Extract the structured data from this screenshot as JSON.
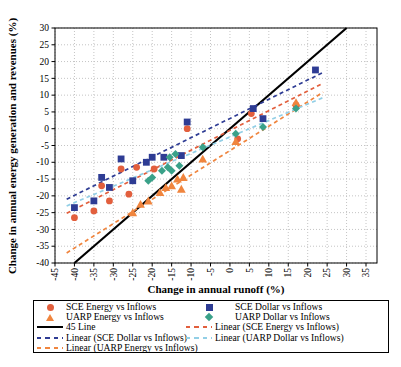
{
  "x_axis": {
    "title": "Change in annual runoff (%)",
    "ticks": [
      -45,
      -40,
      -35,
      -30,
      -25,
      -20,
      -15,
      -10,
      -5,
      0,
      5,
      10,
      15,
      20,
      25,
      30,
      35
    ],
    "min": -45,
    "max": 35
  },
  "y_axis": {
    "title": "Change in annual energy generation and revenues (%)",
    "ticks": [
      30,
      25,
      20,
      15,
      10,
      5,
      0,
      -5,
      -10,
      -15,
      -20,
      -25,
      -30,
      -35,
      -40
    ],
    "min": -40,
    "max": 30
  },
  "colors": {
    "sce_energy": "#e25f3d",
    "sce_dollar": "#2e3c94",
    "uarp_energy": "#f0853e",
    "uarp_dollar": "#3aa189",
    "uarp_dollar_line": "#92cfe6",
    "line_45": "#000000",
    "grid": "#c4c4c4",
    "axis": "#000000"
  },
  "chart_data": {
    "type": "scatter",
    "xlabel": "Change in annual runoff (%)",
    "ylabel": "Change in annual energy generation and revenues (%)",
    "xlim": [
      -45,
      37
    ],
    "ylim": [
      -40,
      30
    ],
    "grid": "dotted",
    "series": [
      {
        "name": "SCE Energy vs Inflows",
        "marker": "circle",
        "color": "#e25f3d",
        "points": [
          [
            -40,
            -26.5
          ],
          [
            -35,
            -24.5
          ],
          [
            -33,
            -17
          ],
          [
            -31,
            -21.5
          ],
          [
            -28,
            -12
          ],
          [
            -26,
            -19.5
          ],
          [
            -24,
            -11.5
          ],
          [
            -19.5,
            -12
          ],
          [
            -11,
            0
          ],
          [
            2,
            -3
          ],
          [
            5.5,
            4.5
          ],
          [
            17,
            7
          ]
        ]
      },
      {
        "name": "SCE Dollar vs Inflows",
        "marker": "square",
        "color": "#2e3c94",
        "points": [
          [
            -40,
            -23.5
          ],
          [
            -35,
            -21.5
          ],
          [
            -33,
            -14.5
          ],
          [
            -31,
            -17.5
          ],
          [
            -28,
            -9
          ],
          [
            -25,
            -15.5
          ],
          [
            -21.5,
            -10
          ],
          [
            -20,
            -8.5
          ],
          [
            -17,
            -8.5
          ],
          [
            -12.5,
            -8
          ],
          [
            -11,
            2
          ],
          [
            6,
            6
          ],
          [
            8.5,
            3
          ],
          [
            22,
            17.5
          ]
        ]
      },
      {
        "name": "UARP Energy vs Inflows",
        "marker": "triangle",
        "color": "#f0853e",
        "points": [
          [
            -25,
            -25
          ],
          [
            -23,
            -22.5
          ],
          [
            -21,
            -21.5
          ],
          [
            -18,
            -19
          ],
          [
            -16.5,
            -17.5
          ],
          [
            -15,
            -17
          ],
          [
            -13.5,
            -15
          ],
          [
            -12.5,
            -18
          ],
          [
            -12,
            -14.5
          ],
          [
            -7,
            -9
          ],
          [
            1.5,
            -3.8
          ],
          [
            17,
            7.8
          ]
        ]
      },
      {
        "name": "UARP Dollar vs Inflows",
        "marker": "diamond",
        "color": "#3aa189",
        "points": [
          [
            -21,
            -15.5
          ],
          [
            -20,
            -14.5
          ],
          [
            -17.5,
            -12.5
          ],
          [
            -16,
            -11.5
          ],
          [
            -15,
            -12.5
          ],
          [
            -13,
            -11
          ],
          [
            -15.5,
            -8.5
          ],
          [
            -14,
            -7.5
          ],
          [
            -7,
            -5.5
          ],
          [
            1.5,
            -1.5
          ],
          [
            8.5,
            0.5
          ],
          [
            17,
            6
          ]
        ]
      }
    ],
    "lines": [
      {
        "name": "45 Line",
        "style": "solid",
        "color": "#000000",
        "width": 2.2,
        "x1": -40,
        "y1": -40,
        "x2": 30,
        "y2": 30
      },
      {
        "name": "Linear (SCE Dollar vs Inflows)",
        "style": "dashed",
        "color": "#2e3c94",
        "width": 1.7,
        "x1": -42,
        "y1": -21.0,
        "x2": 24,
        "y2": 16.8
      },
      {
        "name": "Linear (SCE Energy vs Inflows)",
        "style": "dashed",
        "color": "#e25f3d",
        "width": 1.7,
        "x1": -42,
        "y1": -25.2,
        "x2": 24,
        "y2": 13.6
      },
      {
        "name": "Linear (UARP Energy vs Inflows)",
        "style": "dashed",
        "color": "#f0853e",
        "width": 1.7,
        "x1": -42,
        "y1": -37.0,
        "x2": 24,
        "y2": 10.9
      },
      {
        "name": "Linear (UARP Dollar vs Inflows)",
        "style": "dashed",
        "color": "#92cfe6",
        "width": 1.7,
        "x1": -42,
        "y1": -23.0,
        "x2": 24,
        "y2": 9.3
      }
    ]
  },
  "legend": {
    "col1": [
      {
        "label": "SCE Energy vs Inflows",
        "type": "circle"
      },
      {
        "label": "UARP Energy vs Inflows",
        "type": "triangle"
      },
      {
        "label": "45 Line",
        "type": "solid"
      },
      {
        "label": "Linear (SCE Dollar vs Inflows)",
        "type": "dashed"
      },
      {
        "label": "Linear (UARP Energy vs Inflows)",
        "type": "dashed"
      }
    ],
    "col2": [
      {
        "label": "SCE Dollar vs Inflows",
        "type": "square"
      },
      {
        "label": "UARP Dollar vs Inflows",
        "type": "diamond"
      },
      {
        "label": "Linear (SCE Energy vs Inflows)",
        "type": "dashed"
      },
      {
        "label": "Linear (UARP Dollar vs Inflows)",
        "type": "dashed"
      }
    ]
  }
}
